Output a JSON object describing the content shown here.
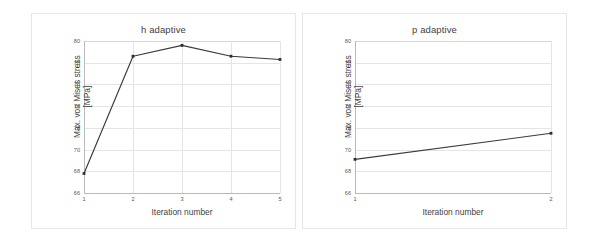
{
  "figure": {
    "background_color": "#ffffff",
    "panel_border_color": "#e6e7e9",
    "series_color": "#3a3a3a",
    "grid_color": "#e4e5e7"
  },
  "panels": [
    {
      "title": "h adaptive"
    },
    {
      "title": "p adaptive"
    }
  ],
  "chart_data": [
    {
      "type": "line",
      "title": "h adaptive",
      "xlabel": "Iteration number",
      "ylabel": "Max. von Mises stress [MPa]",
      "ylabel_lines": [
        "Max. von Mises stress",
        "[MPa]"
      ],
      "x": [
        1,
        2,
        3,
        4,
        5
      ],
      "values": [
        67.8,
        78.6,
        79.6,
        78.6,
        78.3
      ],
      "xticklabels": [
        "1",
        "2",
        "3",
        "4",
        "5"
      ],
      "yticklabels": [
        "66",
        "68",
        "70",
        "72",
        "74",
        "76",
        "78",
        "80"
      ],
      "yticks": [
        66,
        68,
        70,
        72,
        74,
        76,
        78,
        80
      ],
      "xlim": [
        1,
        5
      ],
      "ylim": [
        66,
        80
      ],
      "grid": true,
      "legend": false,
      "markers": "square"
    },
    {
      "type": "line",
      "title": "p adaptive",
      "xlabel": "Iteration number",
      "ylabel": "Max. von Mises stress [MPa]",
      "ylabel_lines": [
        "Max. von Mises stress",
        "[MPa]"
      ],
      "x": [
        1,
        2
      ],
      "values": [
        69.1,
        71.5
      ],
      "xticklabels": [
        "1",
        "2"
      ],
      "yticklabels": [
        "66",
        "68",
        "70",
        "72",
        "74",
        "76",
        "78",
        "80"
      ],
      "yticks": [
        66,
        68,
        70,
        72,
        74,
        76,
        78,
        80
      ],
      "xlim": [
        1,
        2
      ],
      "ylim": [
        66,
        80
      ],
      "grid": true,
      "legend": false,
      "markers": "square"
    }
  ]
}
